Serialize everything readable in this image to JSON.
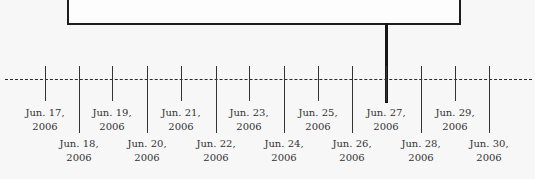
{
  "diagram": {
    "type": "timeline",
    "highlighted_date": "Jun. 27, 2006",
    "dates": [
      {
        "line1": "Jun. 17,",
        "line2": "2006",
        "x": 45,
        "row": "upper"
      },
      {
        "line1": "Jun. 18,",
        "line2": "2006",
        "x": 79,
        "row": "lower"
      },
      {
        "line1": "Jun. 19,",
        "line2": "2006",
        "x": 112,
        "row": "upper"
      },
      {
        "line1": "Jun. 20,",
        "line2": "2006",
        "x": 147,
        "row": "lower"
      },
      {
        "line1": "Jun. 21,",
        "line2": "2006",
        "x": 181,
        "row": "upper"
      },
      {
        "line1": "Jun. 22,",
        "line2": "2006",
        "x": 216,
        "row": "lower"
      },
      {
        "line1": "Jun. 23,",
        "line2": "2006",
        "x": 249,
        "row": "upper"
      },
      {
        "line1": "Jun. 24,",
        "line2": "2006",
        "x": 284,
        "row": "lower"
      },
      {
        "line1": "Jun. 25,",
        "line2": "2006",
        "x": 318,
        "row": "upper"
      },
      {
        "line1": "Jun. 26,",
        "line2": "2006",
        "x": 352,
        "row": "lower"
      },
      {
        "line1": "Jun. 27,",
        "line2": "2006",
        "x": 386,
        "row": "upper"
      },
      {
        "line1": "Jun. 28,",
        "line2": "2006",
        "x": 421,
        "row": "lower"
      },
      {
        "line1": "Jun. 29,",
        "line2": "2006",
        "x": 455,
        "row": "upper"
      },
      {
        "line1": "Jun. 30,",
        "line2": "2006",
        "x": 489,
        "row": "lower"
      }
    ]
  }
}
